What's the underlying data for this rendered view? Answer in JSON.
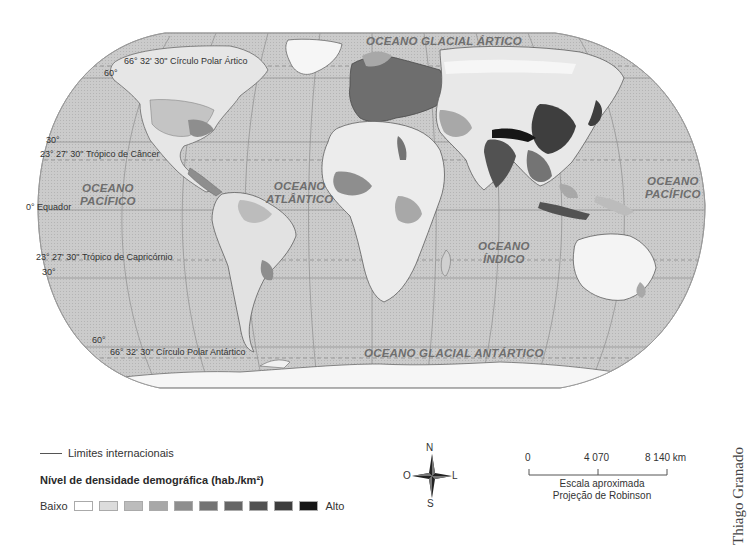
{
  "map": {
    "projection": "Robinson",
    "style": "grayscale choropleth",
    "colors": {
      "ocean": "#c8c8c8",
      "graticule": "#8a8a8a",
      "land_low": "#f2f2f2",
      "land_high": "#141414",
      "frame": "#9a9a9a"
    },
    "ocean_labels": [
      {
        "id": "arctic",
        "text": "OCEANO GLACIAL ÁRTICO"
      },
      {
        "id": "pacific-west",
        "line1": "OCEANO",
        "line2": "PACÍFICO"
      },
      {
        "id": "atlantic",
        "line1": "OCEANO",
        "line2": "ATLÂNTICO"
      },
      {
        "id": "indian",
        "line1": "OCEANO",
        "line2": "ÍNDICO"
      },
      {
        "id": "pacific-east",
        "line1": "OCEANO",
        "line2": "PACÍFICO"
      },
      {
        "id": "antarctic",
        "text": "OCEANO GLACIAL ANTÁRTICO"
      }
    ],
    "parallel_labels": {
      "arctic_circle": "66° 32' 30\" Círculo Polar Ártico",
      "lat_60n": "60°",
      "lat_30n": "30°",
      "tropic_cancer": "23° 27' 30\" Trópico de Câncer",
      "equator": "0° Equador",
      "tropic_capricorn": "23° 27' 30\" Trópico de Capricórnio",
      "lat_30s": "30°",
      "lat_60s": "60°",
      "antarctic_circle": "66° 32' 30\" Círculo Polar Antártico"
    }
  },
  "legend": {
    "boundary_label": "Limites internacionais",
    "density_title": "Nível de densidade demográfica (hab./km²)",
    "low_label": "Baixo",
    "high_label": "Alto",
    "classes": [
      "#ffffff",
      "#dcdcdc",
      "#bcbcbc",
      "#a8a8a8",
      "#8e8e8e",
      "#747474",
      "#666666",
      "#525252",
      "#3e3e3e",
      "#161616"
    ]
  },
  "compass": {
    "north": "N",
    "south": "S",
    "east": "L",
    "west": "O"
  },
  "scale": {
    "ticks": [
      "0",
      "4 070",
      "8 140 km"
    ],
    "caption_line1": "Escala aproximada",
    "caption_line2": "Projeção de Robinson"
  },
  "credit": "Thiago Granado"
}
